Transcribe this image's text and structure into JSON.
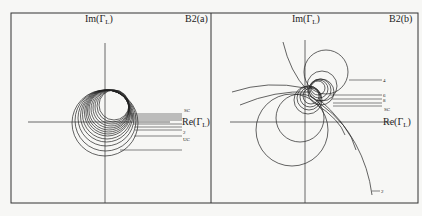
{
  "figure": {
    "panels": [
      {
        "id": "B2(a)",
        "label": "B2(a)",
        "y_axis_label": "Im(Γ",
        "y_axis_sub": "L",
        "x_axis_label": "Re(Γ",
        "x_axis_sub": "L",
        "curve_labels": [
          "SC",
          "2",
          "UC"
        ],
        "description": "Family of nested circles clustered tangent near the top of the imaginary axis, labelled with lead lines on the right."
      },
      {
        "id": "B2(b)",
        "label": "B2(b)",
        "y_axis_label": "Im(Γ",
        "y_axis_sub": "L",
        "x_axis_label": "Re(Γ",
        "x_axis_sub": "L",
        "curve_labels": [
          "4",
          "6",
          "8",
          "SC",
          "2"
        ],
        "description": "Family of circles passing through common points in the upper half, with large arcs extending downward; labelled with lead lines on the right."
      }
    ]
  }
}
